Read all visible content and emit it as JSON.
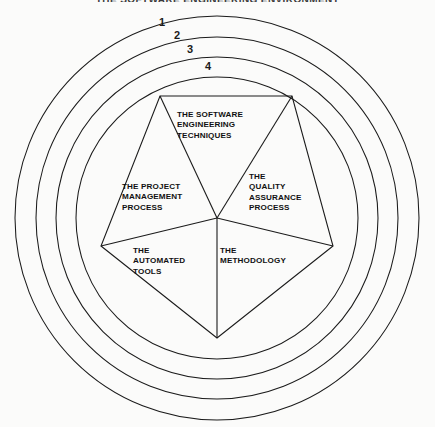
{
  "figure": {
    "title": "THE SOFTWARE ENGINEERING ENVIRONMENT",
    "background_color": "#fbfbfa",
    "line_color": "#1b1b1b",
    "text_color": "#111111"
  },
  "rings": {
    "count": 4,
    "labels": [
      {
        "text": "1",
        "x": 162,
        "y": 26
      },
      {
        "text": "2",
        "x": 177,
        "y": 39
      },
      {
        "text": "3",
        "x": 190,
        "y": 53
      },
      {
        "text": "4",
        "x": 208,
        "y": 70
      }
    ],
    "center": {
      "x": 217,
      "y": 218
    },
    "radii": [
      202,
      181,
      161,
      141
    ]
  },
  "pentagon": {
    "center": {
      "x": 217,
      "y": 218
    },
    "vertices": [
      {
        "x": 160,
        "y": 96
      },
      {
        "x": 292,
        "y": 96
      },
      {
        "x": 333,
        "y": 246
      },
      {
        "x": 217,
        "y": 338
      },
      {
        "x": 101,
        "y": 246
      }
    ],
    "sectors": [
      {
        "name": "software-engineering",
        "label": "THE SOFTWARE\nENGINEERING\nTECHNIQUES"
      },
      {
        "name": "quality-assurance",
        "label": "THE\nQUALITY\nASSURANCE\nPROCESS"
      },
      {
        "name": "methodology",
        "label": "THE\nMETHODOLOGY"
      },
      {
        "name": "automated-tools",
        "label": "THE\nAUTOMATED\nTOOLS"
      },
      {
        "name": "project-management",
        "label": "THE PROJECT\nMANAGEMENT\nPROCESS"
      }
    ]
  }
}
